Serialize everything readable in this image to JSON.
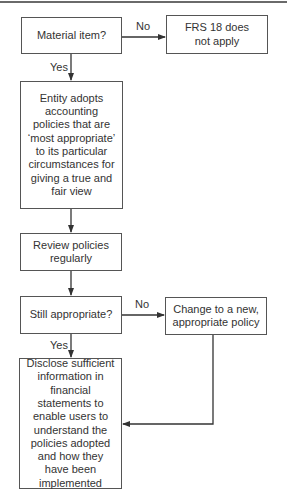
{
  "diagram": {
    "nodes": {
      "material": {
        "text": "Material item?"
      },
      "frs": {
        "text": "FRS 18 does not apply"
      },
      "entity": {
        "text": "Entity adopts accounting policies that are ‘most appropriate’ to its particular circumstances for giving a true and fair view"
      },
      "review": {
        "text": "Review policies regularly"
      },
      "still": {
        "text": "Still appropriate?"
      },
      "change": {
        "text": "Change to a new, appropriate policy"
      },
      "disclose": {
        "text": "Disclose sufficient information in financial statements to enable users to understand the policies adopted and how they have been implemented"
      }
    },
    "edges": {
      "no1": "No",
      "yes1": "Yes",
      "no2": "No",
      "yes2": "Yes"
    },
    "colors": {
      "line": "#333333",
      "border": "#555555"
    }
  }
}
